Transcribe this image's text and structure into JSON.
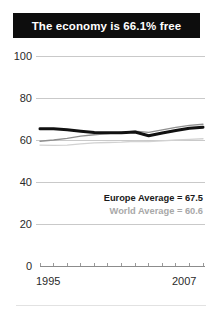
{
  "banner": {
    "title": "The economy is 66.1% free"
  },
  "legend": {
    "europe": "Europe Average = 67.5",
    "world": "World Average = 60.6"
  },
  "axis": {
    "y_ticks": [
      "100",
      "80",
      "60",
      "40",
      "20",
      "0"
    ],
    "x_start": "1995",
    "x_end": "2007"
  },
  "colors": {
    "banner_background": "#0d0d0d",
    "banner_text": "#ffffff",
    "country_line": "#111111",
    "europe_line": "#8f8f8f",
    "world_line": "#d2d2d2",
    "gridline": "#c9c9c9",
    "legend_europe_text": "#1a1a1a",
    "legend_world_text": "#a8a8a8"
  },
  "chart_data": {
    "type": "line",
    "title": "The economy is 66.1% free",
    "xlabel": "",
    "ylabel": "",
    "xlim": [
      1995,
      2007
    ],
    "ylim": [
      0,
      100
    ],
    "grid": true,
    "legend_position": "inside-right",
    "x": [
      1995,
      1996,
      1997,
      1998,
      1999,
      2000,
      2001,
      2002,
      2003,
      2004,
      2005,
      2006,
      2007
    ],
    "series": [
      {
        "name": "Country score",
        "color": "#111111",
        "linewidth": 3,
        "values": [
          65.4,
          65.3,
          64.9,
          64.2,
          63.6,
          63.4,
          63.5,
          63.8,
          62.0,
          63.3,
          64.5,
          65.6,
          66.1
        ]
      },
      {
        "name": "Europe Average",
        "color": "#8f8f8f",
        "linewidth": 1.3,
        "label": "Europe Average = 67.5",
        "values": [
          59.4,
          60.0,
          60.8,
          61.8,
          62.5,
          63.1,
          63.6,
          64.2,
          63.6,
          64.8,
          66.0,
          67.0,
          67.5
        ]
      },
      {
        "name": "World Average",
        "color": "#d2d2d2",
        "linewidth": 1.3,
        "label": "World Average = 60.6",
        "values": [
          57.6,
          57.4,
          57.6,
          58.2,
          58.6,
          58.8,
          59.0,
          59.4,
          59.2,
          59.6,
          60.0,
          60.3,
          60.6
        ]
      }
    ],
    "annotations": [
      {
        "text": "Europe Average = 67.5",
        "style": "bold-dark"
      },
      {
        "text": "World Average = 60.6",
        "style": "bold-gray"
      }
    ]
  }
}
